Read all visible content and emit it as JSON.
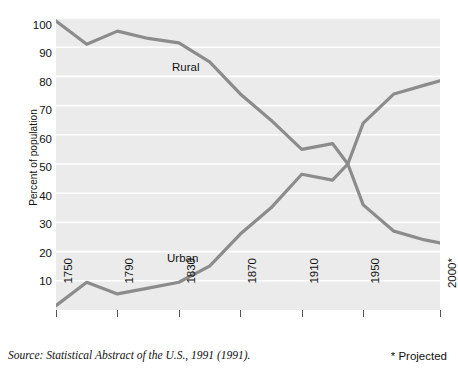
{
  "chart_data": {
    "type": "line",
    "title": "",
    "xlabel": "",
    "ylabel": "Percent of population",
    "xlim": [
      1750,
      2000
    ],
    "ylim": [
      0,
      100
    ],
    "grid": true,
    "grid_orientation": "horizontal",
    "legend_position": "inline-labels",
    "x_tick_labels": [
      "1750",
      "1790",
      "1830",
      "1870",
      "1910",
      "1950",
      "2000*"
    ],
    "x_tick_values": [
      1750,
      1790,
      1830,
      1870,
      1910,
      1950,
      2000
    ],
    "y_tick_labels": [
      "10",
      "20",
      "30",
      "40",
      "50",
      "60",
      "70",
      "80",
      "90",
      "100"
    ],
    "y_tick_values": [
      10,
      20,
      30,
      40,
      50,
      60,
      70,
      80,
      90,
      100
    ],
    "x": [
      1750,
      1770,
      1790,
      1810,
      1830,
      1850,
      1870,
      1890,
      1910,
      1930,
      1940,
      1950,
      1970,
      1990,
      2000
    ],
    "series": [
      {
        "name": "Rural",
        "label": "Rural",
        "color": "#8c8c8c",
        "values": [
          99,
          91,
          95.5,
          93,
          91.5,
          85,
          74,
          65,
          55,
          57,
          50,
          36,
          27,
          24,
          23
        ]
      },
      {
        "name": "Urban",
        "label": "Urban",
        "color": "#8c8c8c",
        "values": [
          1.5,
          9.5,
          5.5,
          7.5,
          9.5,
          15,
          26,
          35,
          46.5,
          44.5,
          50,
          64,
          74,
          77,
          78.5
        ]
      }
    ],
    "annotations": {
      "source": "Source: Statistical Abstract of the U.S., 1991 (1991).",
      "projected": "* Projected"
    },
    "colors": {
      "plot_background": "#ebebeb",
      "gridline": "#ffffff",
      "line": "#8c8c8c",
      "text": "#111111",
      "page_background": "#ffffff"
    }
  }
}
